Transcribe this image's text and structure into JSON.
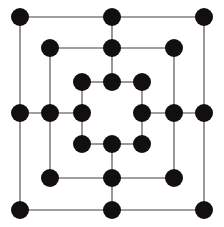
{
  "figure": {
    "background_color": "#ffffff",
    "node_color": "#140f0f",
    "edge_color": "#7f7f7f",
    "node_radius": 9,
    "edge_width": 1.6,
    "width": 224,
    "height": 227,
    "node_count": 24,
    "edge_count": 28,
    "ring_count": 3
  },
  "chart_data": {
    "type": "diagram",
    "xlabel": "",
    "ylabel": "",
    "rings": [
      {
        "name": "outer",
        "left": 20,
        "right": 204,
        "top": 17,
        "bottom": 210,
        "mid_x": 112,
        "mid_y": 113
      },
      {
        "name": "middle",
        "left": 50,
        "right": 174,
        "top": 48,
        "bottom": 178,
        "mid_x": 112,
        "mid_y": 113
      },
      {
        "name": "inner",
        "left": 82,
        "right": 142,
        "top": 82,
        "bottom": 144,
        "mid_x": 112,
        "mid_y": 113
      }
    ],
    "nodes": [
      {
        "id": "o-tl",
        "ring": "outer",
        "position": "top-left",
        "x": 20,
        "y": 17
      },
      {
        "id": "o-tc",
        "ring": "outer",
        "position": "top-center",
        "x": 112,
        "y": 17
      },
      {
        "id": "o-tr",
        "ring": "outer",
        "position": "top-right",
        "x": 204,
        "y": 17
      },
      {
        "id": "o-ml",
        "ring": "outer",
        "position": "middle-left",
        "x": 20,
        "y": 113
      },
      {
        "id": "o-mr",
        "ring": "outer",
        "position": "middle-right",
        "x": 204,
        "y": 113
      },
      {
        "id": "o-bl",
        "ring": "outer",
        "position": "bottom-left",
        "x": 20,
        "y": 210
      },
      {
        "id": "o-bc",
        "ring": "outer",
        "position": "bottom-center",
        "x": 112,
        "y": 210
      },
      {
        "id": "o-br",
        "ring": "outer",
        "position": "bottom-right",
        "x": 204,
        "y": 210
      },
      {
        "id": "m-tl",
        "ring": "middle",
        "position": "top-left",
        "x": 50,
        "y": 48
      },
      {
        "id": "m-tc",
        "ring": "middle",
        "position": "top-center",
        "x": 112,
        "y": 48
      },
      {
        "id": "m-tr",
        "ring": "middle",
        "position": "top-right",
        "x": 174,
        "y": 48
      },
      {
        "id": "m-ml",
        "ring": "middle",
        "position": "middle-left",
        "x": 50,
        "y": 113
      },
      {
        "id": "m-mr",
        "ring": "middle",
        "position": "middle-right",
        "x": 174,
        "y": 113
      },
      {
        "id": "m-bl",
        "ring": "middle",
        "position": "bottom-left",
        "x": 50,
        "y": 178
      },
      {
        "id": "m-bc",
        "ring": "middle",
        "position": "bottom-center",
        "x": 112,
        "y": 178
      },
      {
        "id": "m-br",
        "ring": "middle",
        "position": "bottom-right",
        "x": 174,
        "y": 178
      },
      {
        "id": "i-tl",
        "ring": "inner",
        "position": "top-left",
        "x": 82,
        "y": 82
      },
      {
        "id": "i-tc",
        "ring": "inner",
        "position": "top-center",
        "x": 112,
        "y": 82
      },
      {
        "id": "i-tr",
        "ring": "inner",
        "position": "top-right",
        "x": 142,
        "y": 82
      },
      {
        "id": "i-ml",
        "ring": "inner",
        "position": "middle-left",
        "x": 82,
        "y": 113
      },
      {
        "id": "i-mr",
        "ring": "inner",
        "position": "middle-right",
        "x": 142,
        "y": 113
      },
      {
        "id": "i-bl",
        "ring": "inner",
        "position": "bottom-left",
        "x": 82,
        "y": 144
      },
      {
        "id": "i-bc",
        "ring": "inner",
        "position": "bottom-center",
        "x": 112,
        "y": 144
      },
      {
        "id": "i-br",
        "ring": "inner",
        "position": "bottom-right",
        "x": 142,
        "y": 144
      }
    ],
    "edges": [
      {
        "from": "o-tl",
        "to": "o-tc",
        "kind": "ring"
      },
      {
        "from": "o-tc",
        "to": "o-tr",
        "kind": "ring"
      },
      {
        "from": "o-tr",
        "to": "o-mr",
        "kind": "ring"
      },
      {
        "from": "o-mr",
        "to": "o-br",
        "kind": "ring"
      },
      {
        "from": "o-br",
        "to": "o-bc",
        "kind": "ring"
      },
      {
        "from": "o-bc",
        "to": "o-bl",
        "kind": "ring"
      },
      {
        "from": "o-bl",
        "to": "o-ml",
        "kind": "ring"
      },
      {
        "from": "o-ml",
        "to": "o-tl",
        "kind": "ring"
      },
      {
        "from": "m-tl",
        "to": "m-tc",
        "kind": "ring"
      },
      {
        "from": "m-tc",
        "to": "m-tr",
        "kind": "ring"
      },
      {
        "from": "m-tr",
        "to": "m-mr",
        "kind": "ring"
      },
      {
        "from": "m-mr",
        "to": "m-br",
        "kind": "ring"
      },
      {
        "from": "m-br",
        "to": "m-bc",
        "kind": "ring"
      },
      {
        "from": "m-bc",
        "to": "m-bl",
        "kind": "ring"
      },
      {
        "from": "m-bl",
        "to": "m-ml",
        "kind": "ring"
      },
      {
        "from": "m-ml",
        "to": "m-tl",
        "kind": "ring"
      },
      {
        "from": "i-tl",
        "to": "i-tc",
        "kind": "ring"
      },
      {
        "from": "i-tc",
        "to": "i-tr",
        "kind": "ring"
      },
      {
        "from": "i-tr",
        "to": "i-mr",
        "kind": "ring"
      },
      {
        "from": "i-mr",
        "to": "i-br",
        "kind": "ring"
      },
      {
        "from": "i-br",
        "to": "i-bc",
        "kind": "ring"
      },
      {
        "from": "i-bc",
        "to": "i-bl",
        "kind": "ring"
      },
      {
        "from": "i-bl",
        "to": "i-ml",
        "kind": "ring"
      },
      {
        "from": "i-ml",
        "to": "i-tl",
        "kind": "ring"
      },
      {
        "from": "o-tc",
        "to": "i-tc",
        "kind": "spoke"
      },
      {
        "from": "o-bc",
        "to": "i-bc",
        "kind": "spoke"
      },
      {
        "from": "o-ml",
        "to": "i-ml",
        "kind": "spoke"
      },
      {
        "from": "o-mr",
        "to": "i-mr",
        "kind": "spoke"
      }
    ]
  }
}
